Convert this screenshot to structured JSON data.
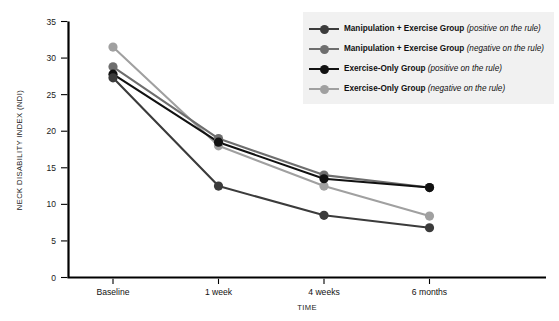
{
  "chart_data": {
    "type": "line",
    "title": "",
    "subtitle": "",
    "xlabel": "TIME",
    "ylabel": "NECK DISABILITY INDEX (NDI)",
    "categories": [
      "Baseline",
      "1 week",
      "4 weeks",
      "6 months"
    ],
    "ylim": [
      0,
      35
    ],
    "yticks": [
      0,
      5,
      10,
      15,
      20,
      25,
      30,
      35
    ],
    "grid": false,
    "legend_position": "top-right",
    "series": [
      {
        "name": "Manipulation + Exercise Group",
        "qualifier": "(positive on the rule)",
        "color": "#3b3b3b",
        "values": [
          27.3,
          12.5,
          8.5,
          6.8
        ]
      },
      {
        "name": "Manipulation + Exercise Group",
        "qualifier": "(negative on the rule)",
        "color": "#6e6e6e",
        "values": [
          28.8,
          19.0,
          14.0,
          12.3
        ]
      },
      {
        "name": "Exercise-Only Group",
        "qualifier": "(positive on the rule)",
        "color": "#111111",
        "values": [
          27.8,
          18.5,
          13.5,
          12.3
        ]
      },
      {
        "name": "Exercise-Only Group",
        "qualifier": "(negative on the rule)",
        "color": "#a0a0a0",
        "values": [
          31.5,
          18.0,
          12.5,
          8.4
        ]
      }
    ]
  },
  "axes": {
    "y_tick_labels": [
      "0",
      "5",
      "10",
      "15",
      "20",
      "25",
      "30",
      "35"
    ],
    "y_axis_title": "NECK DISABILITY INDEX (NDI)",
    "x_axis_title": "TIME",
    "x_tick_labels": [
      "Baseline",
      "1 week",
      "4 weeks",
      "6 months"
    ]
  },
  "legend": {
    "items": [
      {
        "label": "Manipulation + Exercise Group",
        "qualifier": "(positive on the rule)",
        "color": "#3b3b3b",
        "marker": "circle-marker"
      },
      {
        "label": "Manipulation + Exercise Group",
        "qualifier": "(negative on the rule)",
        "color": "#6e6e6e",
        "marker": "circle-marker"
      },
      {
        "label": "Exercise-Only Group",
        "qualifier": "(positive on the rule)",
        "color": "#111111",
        "marker": "circle-marker"
      },
      {
        "label": "Exercise-Only Group",
        "qualifier": "(negative on the rule)",
        "color": "#a0a0a0",
        "marker": "circle-marker"
      }
    ],
    "background_color": "#f1f1f1"
  }
}
